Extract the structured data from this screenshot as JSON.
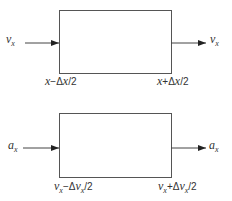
{
  "diagram": {
    "top": {
      "input_label": {
        "var": "v",
        "sub": "x"
      },
      "output_label": {
        "var": "v",
        "sub": "x"
      },
      "left_edge_label": {
        "a": "x",
        "op": "−Δ",
        "b": "x",
        "tail": "/2"
      },
      "right_edge_label": {
        "a": "x",
        "op": "+Δ",
        "b": "x",
        "tail": "/2"
      }
    },
    "bottom": {
      "input_label": {
        "var": "a",
        "sub": "x"
      },
      "output_label": {
        "var": "a",
        "sub": "x"
      },
      "left_edge_label": {
        "a": "v",
        "a_sub": "x",
        "op": "−Δ",
        "b": "v",
        "b_sub": "x",
        "tail": "/2"
      },
      "right_edge_label": {
        "a": "v",
        "a_sub": "x",
        "op": "+Δ",
        "b": "v",
        "b_sub": "x",
        "tail": "/2"
      }
    },
    "stroke_color": "#555555"
  }
}
